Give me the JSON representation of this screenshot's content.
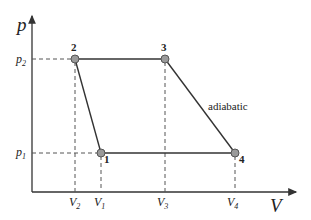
{
  "diagram": {
    "type": "p-V diagram (thermodynamic cycle)",
    "axes": {
      "y_label": "p",
      "x_label": "V",
      "y_ticks": [
        {
          "label": "p",
          "sub": "2"
        },
        {
          "label": "p",
          "sub": "1"
        }
      ],
      "x_ticks": [
        {
          "label": "V",
          "sub": "2"
        },
        {
          "label": "V",
          "sub": "1"
        },
        {
          "label": "V",
          "sub": "3"
        },
        {
          "label": "V",
          "sub": "4"
        }
      ]
    },
    "points": [
      {
        "id": "1",
        "label": "1",
        "V": "V1",
        "p": "p1"
      },
      {
        "id": "2",
        "label": "2",
        "V": "V2",
        "p": "p2"
      },
      {
        "id": "3",
        "label": "3",
        "V": "V3",
        "p": "p2"
      },
      {
        "id": "4",
        "label": "4",
        "V": "V4",
        "p": "p1"
      }
    ],
    "annotation": "adiabatic",
    "colors": {
      "line": "#333333",
      "point_fill": "#9a9a9a",
      "point_stroke": "#555555",
      "dashed": "#555555"
    }
  }
}
